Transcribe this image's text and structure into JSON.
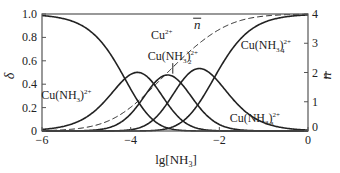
{
  "chart_data": {
    "type": "line",
    "title": "",
    "xlabel": "lg[NH3]",
    "ylabel_left": "δ",
    "ylabel_right": "n̄",
    "xlim": [
      -6,
      0
    ],
    "ylim_left": [
      0,
      1.0
    ],
    "ylim_right": [
      0,
      4
    ],
    "x_ticks": [
      -6,
      -4,
      -2,
      0
    ],
    "x_tick_labels": [
      "−6",
      "−4",
      "−2",
      "0"
    ],
    "y_ticks_left": [
      0,
      0.2,
      0.4,
      0.6,
      0.8,
      1.0
    ],
    "y_tick_labels_left": [
      "0",
      "0.2",
      "0.4",
      "0.6",
      "0.8",
      "1.0"
    ],
    "y_ticks_right": [
      0,
      1,
      2,
      3,
      4
    ],
    "y_tick_labels_right": [
      "0",
      "1",
      "2",
      "3",
      "4"
    ],
    "grid": false,
    "legend": "inline labels",
    "model": {
      "description": "Distribution fractions of Cu(II)-NH3 complexes, cumulative stability constants lgβ",
      "lg_beta": [
        4.13,
        7.61,
        10.48,
        12.59
      ]
    },
    "series": [
      {
        "name": "Cu2+",
        "label_main": "Cu",
        "label_sup": "2+",
        "style": "solid",
        "axis": "left",
        "index": 0,
        "x": [
          -6,
          -5,
          -4.5,
          -4,
          -3.5,
          -3,
          -2.5,
          -2,
          -1
        ],
        "values": [
          0.99,
          0.88,
          0.66,
          0.36,
          0.1,
          0.02,
          0.0,
          0.0,
          0.0
        ]
      },
      {
        "name": "Cu(NH3)2+",
        "label_main": "Cu(NH3)",
        "label_sub": "",
        "label_sup": "2+",
        "style": "solid",
        "axis": "left",
        "index": 1,
        "x": [
          -6,
          -5,
          -4.5,
          -4,
          -3.5,
          -3,
          -2.5,
          -2,
          -1
        ],
        "values": [
          0.01,
          0.12,
          0.28,
          0.49,
          0.4,
          0.16,
          0.04,
          0.01,
          0.0
        ]
      },
      {
        "name": "Cu(NH3)2 2+",
        "label_main": "Cu(NH3)",
        "label_sub": "2",
        "label_sup": "2+",
        "style": "solid",
        "axis": "left",
        "index": 2,
        "x": [
          -6,
          -5,
          -4.5,
          -4,
          -3.5,
          -3,
          -2.5,
          -2,
          -1
        ],
        "values": [
          0.0,
          0.0,
          0.03,
          0.14,
          0.36,
          0.44,
          0.23,
          0.06,
          0.0
        ]
      },
      {
        "name": "Cu(NH3)3 2+",
        "label_main": "Cu(NH3)",
        "label_sub": "3",
        "label_sup": "2+",
        "style": "solid",
        "axis": "left",
        "index": 3,
        "x": [
          -6,
          -5,
          -4.5,
          -4,
          -3.5,
          -3,
          -2.5,
          -2,
          -1
        ],
        "values": [
          0.0,
          0.0,
          0.0,
          0.01,
          0.08,
          0.31,
          0.54,
          0.4,
          0.07
        ]
      },
      {
        "name": "Cu(NH3)4 2+",
        "label_main": "Cu(NH3)",
        "label_sub": "4",
        "label_sup": "2+",
        "style": "solid",
        "axis": "left",
        "index": 4,
        "x": [
          -6,
          -5,
          -4.5,
          -4,
          -3.5,
          -3,
          -2.5,
          -2,
          -1,
          0
        ],
        "values": [
          0.0,
          0.0,
          0.0,
          0.0,
          0.01,
          0.07,
          0.19,
          0.53,
          0.93,
          0.99
        ]
      },
      {
        "name": "n̄ (average ligand number)",
        "label_main": "n",
        "style": "dashed",
        "axis": "right",
        "index": "nbar",
        "x": [
          -6,
          -5,
          -4.5,
          -4,
          -3.5,
          -3,
          -2.5,
          -2,
          -1,
          0
        ],
        "values": [
          0.0,
          0.12,
          0.37,
          0.78,
          1.5,
          2.28,
          2.84,
          3.45,
          3.93,
          3.99
        ]
      }
    ],
    "annotations": [
      {
        "series": "Cu2+",
        "x": -3.3,
        "y": 0.79
      },
      {
        "series": "Cu(NH3)2+",
        "x": -5.45,
        "y": 0.27
      },
      {
        "series": "Cu(NH3)2 2+",
        "x": -3.05,
        "y": 0.61
      },
      {
        "series": "Cu(NH3)3 2+",
        "x": -1.2,
        "y": 0.08
      },
      {
        "series": "Cu(NH3)4 2+",
        "x": -0.95,
        "y": 0.7
      },
      {
        "series": "n̄",
        "x": -2.5,
        "y": 0.87
      }
    ]
  },
  "colors": {
    "line": "#222222",
    "axis": "#555555",
    "text": "#222222"
  }
}
